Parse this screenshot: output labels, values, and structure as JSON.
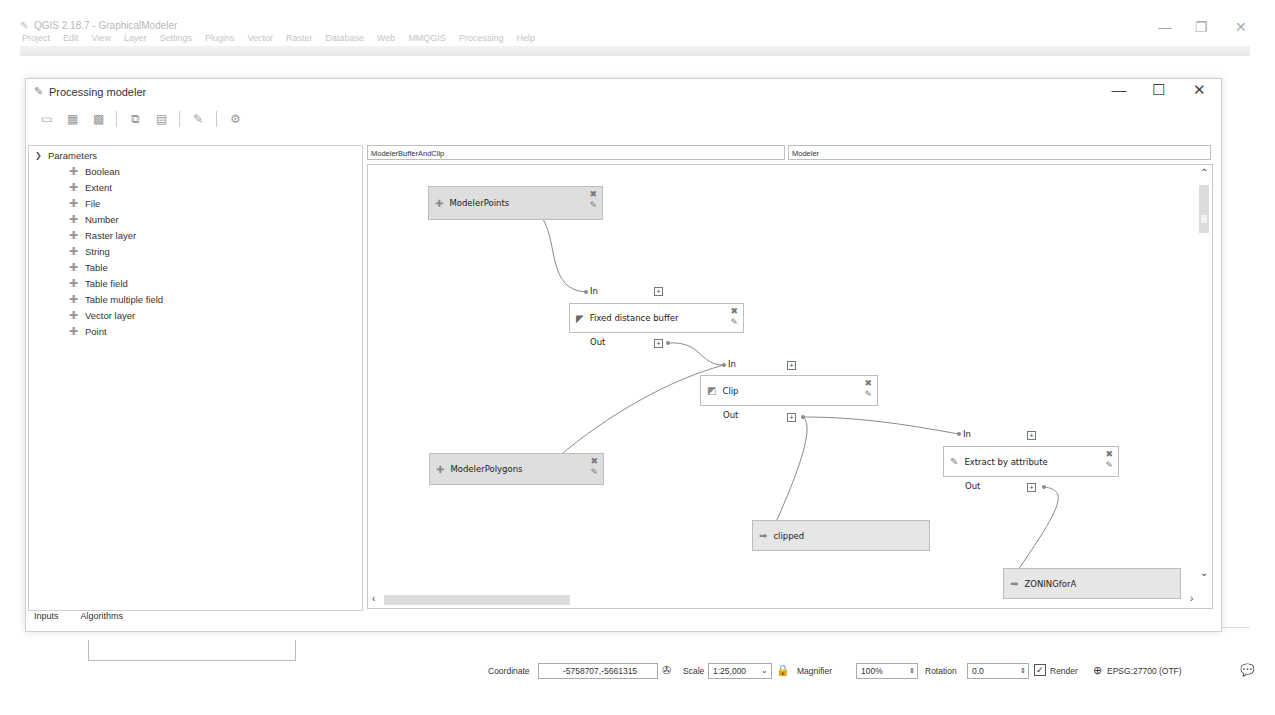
{
  "app": {
    "title": "QGIS 2.18.7 - GraphicalModeler",
    "menu": [
      "Project",
      "Edit",
      "View",
      "Layer",
      "Settings",
      "Plugins",
      "Vector",
      "Raster",
      "Database",
      "Web",
      "MMQGIS",
      "Processing",
      "Help"
    ],
    "window_controls": {
      "minimize": "—",
      "restore": "❐",
      "close": "✕"
    }
  },
  "dialog": {
    "title": "Processing modeler",
    "window_controls": {
      "minimize": "—",
      "maximize": "☐",
      "close": "✕"
    },
    "toolbar": [
      {
        "name": "open-model-icon",
        "glyph": "▭"
      },
      {
        "name": "save-model-icon",
        "glyph": "▦"
      },
      {
        "name": "save-as-model-icon",
        "glyph": "▩"
      },
      {
        "name": "export-image-icon",
        "glyph": "⧉"
      },
      {
        "name": "export-python-icon",
        "glyph": "▤"
      },
      {
        "name": "edit-help-icon",
        "glyph": "✎"
      },
      {
        "name": "run-model-icon",
        "glyph": "⚙"
      }
    ],
    "inputs_panel": {
      "root_label": "Parameters",
      "items": [
        "Boolean",
        "Extent",
        "File",
        "Number",
        "Raster layer",
        "String",
        "Table",
        "Table field",
        "Table multiple field",
        "Vector layer",
        "Point"
      ],
      "tabs": [
        "Inputs",
        "Algorithms"
      ]
    },
    "model_name": "ModelerBufferAndClip",
    "model_group": "Modeler",
    "canvas": {
      "nodes": [
        {
          "id": "modeler-points",
          "type": "param",
          "label": "ModelerPoints"
        },
        {
          "id": "fixed-distance-buffer",
          "type": "alg",
          "label": "Fixed distance buffer",
          "in": "In",
          "out": "Out"
        },
        {
          "id": "clip",
          "type": "alg",
          "label": "Clip",
          "in": "In",
          "out": "Out"
        },
        {
          "id": "modeler-polygons",
          "type": "param",
          "label": "ModelerPolygons"
        },
        {
          "id": "extract-by-attribute",
          "type": "alg",
          "label": "Extract by attribute",
          "in": "In",
          "out": "Out"
        },
        {
          "id": "clipped",
          "type": "out",
          "label": "clipped"
        },
        {
          "id": "zoning-for-a",
          "type": "out",
          "label": "ZONINGforA"
        }
      ],
      "expand_glyph": "+"
    }
  },
  "statusbar": {
    "coordinate_label": "Coordinate",
    "coordinate_value": "-5758707,-5661315",
    "scale_label": "Scale",
    "scale_value": "1:25,000",
    "magnifier_label": "Magnifier",
    "magnifier_value": "100%",
    "rotation_label": "Rotation",
    "rotation_value": "0.0",
    "render_label": "Render",
    "render_checked": true,
    "crs_label": "EPSG:27700 (OTF)"
  }
}
